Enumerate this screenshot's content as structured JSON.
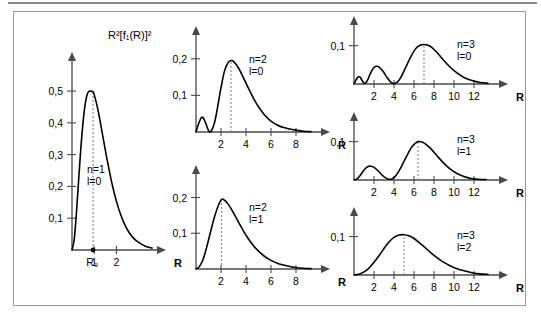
{
  "figure": {
    "y_axis_title": "R²[f₁(R)]²",
    "axis_letter": "R",
    "decimal_separator": ",",
    "frame_color": "#9a9a9a",
    "curve_color": "#000000",
    "axis_color": "#4a4a4a",
    "dashed_color": "#7a7a7a"
  },
  "panels": [
    {
      "id": "n1-l0",
      "n_label": "n=1",
      "l_label": "l=0",
      "y_ticks": [
        "0,1",
        "0,2",
        "0,3",
        "0,4",
        "0,5"
      ],
      "y_tick_values": [
        0.1,
        0.2,
        0.3,
        0.4,
        0.5
      ],
      "x_ticks": [
        "1",
        "2"
      ],
      "x_tick_values": [
        1,
        2
      ],
      "x_origin_label": "R₀",
      "x_axis_label": "R",
      "peak_r": 0.95,
      "peak_value": 0.5,
      "xlim": [
        0,
        3.6
      ],
      "ylim": [
        0,
        0.56
      ]
    },
    {
      "id": "n2-l0",
      "n_label": "n=2",
      "l_label": "l=0",
      "y_ticks": [
        "0,1",
        "0,2"
      ],
      "y_tick_values": [
        0.1,
        0.2
      ],
      "x_ticks": [
        "2",
        "4",
        "6",
        "8"
      ],
      "x_tick_values": [
        2,
        4,
        6,
        8
      ],
      "x_axis_label": "R",
      "peak_r": 2.8,
      "peak_value": 0.195,
      "xlim": [
        0,
        9.6
      ],
      "ylim": [
        0,
        0.235
      ]
    },
    {
      "id": "n2-l1",
      "n_label": "n=2",
      "l_label": "l=1",
      "y_ticks": [
        "0,1",
        "0,2"
      ],
      "y_tick_values": [
        0.1,
        0.2
      ],
      "x_ticks": [
        "2",
        "4",
        "6",
        "8"
      ],
      "x_tick_values": [
        2,
        4,
        6,
        8
      ],
      "x_axis_label": "R",
      "peak_r": 2.05,
      "peak_value": 0.195,
      "xlim": [
        0,
        9.6
      ],
      "ylim": [
        0,
        0.235
      ]
    },
    {
      "id": "n3-l0",
      "n_label": "n=3",
      "l_label": "l=0",
      "y_ticks": [
        "0,1"
      ],
      "y_tick_values": [
        0.1
      ],
      "x_ticks": [
        "2",
        "4",
        "6",
        "8",
        "10",
        "12"
      ],
      "x_tick_values": [
        2,
        4,
        6,
        8,
        10,
        12
      ],
      "x_axis_label": "R",
      "peak_r": 7.0,
      "peak_value": 0.103,
      "xlim": [
        0,
        14.0
      ],
      "ylim": [
        0,
        0.125
      ]
    },
    {
      "id": "n3-l1",
      "n_label": "n=3",
      "l_label": "l=1",
      "y_ticks": [
        "0,1"
      ],
      "y_tick_values": [
        0.1
      ],
      "x_ticks": [
        "2",
        "4",
        "6",
        "8",
        "10",
        "12"
      ],
      "x_tick_values": [
        2,
        4,
        6,
        8,
        10,
        12
      ],
      "x_axis_label": "R",
      "peak_r": 6.4,
      "peak_value": 0.1,
      "xlim": [
        0,
        14.0
      ],
      "ylim": [
        0,
        0.125
      ]
    },
    {
      "id": "n3-l2",
      "n_label": "n=3",
      "l_label": "l=2",
      "y_ticks": [
        "0,1"
      ],
      "y_tick_values": [
        0.1
      ],
      "x_ticks": [
        "2",
        "4",
        "6",
        "8",
        "10",
        "12"
      ],
      "x_tick_values": [
        2,
        4,
        6,
        8,
        10,
        12
      ],
      "x_axis_label": "R",
      "peak_r": 5.0,
      "peak_value": 0.105,
      "xlim": [
        0,
        14.0
      ],
      "ylim": [
        0,
        0.125
      ]
    }
  ],
  "chart_data": [
    {
      "type": "line",
      "id": "n1-l0",
      "title": "n=1, l=0",
      "xlabel": "R",
      "ylabel": "R²[f₁(R)]²",
      "xlim": [
        0,
        3.6
      ],
      "ylim": [
        0,
        0.56
      ],
      "grid": false,
      "annotations": [
        "R₀ marks the peak position"
      ],
      "x": [
        0,
        0.1,
        0.2,
        0.3,
        0.4,
        0.5,
        0.6,
        0.7,
        0.8,
        0.9,
        0.95,
        1.0,
        1.1,
        1.2,
        1.4,
        1.6,
        1.8,
        2.0,
        2.2,
        2.4,
        2.6,
        2.8,
        3.0,
        3.3,
        3.6
      ],
      "y": [
        0,
        0.033,
        0.117,
        0.222,
        0.322,
        0.404,
        0.462,
        0.493,
        0.5,
        0.499,
        0.497,
        0.488,
        0.462,
        0.43,
        0.353,
        0.277,
        0.209,
        0.153,
        0.109,
        0.076,
        0.052,
        0.035,
        0.024,
        0.012,
        0.006
      ]
    },
    {
      "type": "line",
      "id": "n2-l0",
      "title": "n=2, l=0",
      "xlabel": "R",
      "ylabel": "",
      "xlim": [
        0,
        9.6
      ],
      "ylim": [
        0,
        0.235
      ],
      "grid": false,
      "x": [
        0,
        0.2,
        0.4,
        0.5,
        0.6,
        0.8,
        1.0,
        1.2,
        1.5,
        1.8,
        2.0,
        2.3,
        2.6,
        2.8,
        3.0,
        3.4,
        3.8,
        4.2,
        4.6,
        5.0,
        5.5,
        6.0,
        6.5,
        7.0,
        7.5,
        8.0,
        8.6,
        9.2
      ],
      "y": [
        0,
        0.022,
        0.038,
        0.04,
        0.038,
        0.022,
        0.004,
        0.002,
        0.028,
        0.082,
        0.121,
        0.169,
        0.191,
        0.195,
        0.193,
        0.175,
        0.148,
        0.119,
        0.092,
        0.069,
        0.046,
        0.03,
        0.019,
        0.012,
        0.008,
        0.005,
        0.002,
        0.001
      ]
    },
    {
      "type": "line",
      "id": "n2-l1",
      "title": "n=2, l=1",
      "xlabel": "R",
      "ylabel": "",
      "xlim": [
        0,
        9.6
      ],
      "ylim": [
        0,
        0.235
      ],
      "grid": false,
      "x": [
        0,
        0.3,
        0.6,
        0.9,
        1.2,
        1.5,
        1.8,
        2.05,
        2.3,
        2.6,
        3.0,
        3.4,
        3.8,
        4.2,
        4.6,
        5.0,
        5.5,
        6.0,
        6.5,
        7.0,
        7.5,
        8.0,
        8.6,
        9.2
      ],
      "y": [
        0,
        0.008,
        0.03,
        0.067,
        0.109,
        0.148,
        0.179,
        0.195,
        0.192,
        0.18,
        0.157,
        0.131,
        0.106,
        0.084,
        0.065,
        0.05,
        0.035,
        0.024,
        0.016,
        0.011,
        0.007,
        0.004,
        0.002,
        0.001
      ]
    },
    {
      "type": "line",
      "id": "n3-l0",
      "title": "n=3, l=0",
      "xlabel": "R",
      "ylabel": "",
      "xlim": [
        0,
        14.0
      ],
      "ylim": [
        0,
        0.125
      ],
      "grid": false,
      "x": [
        0,
        0.2,
        0.4,
        0.5,
        0.6,
        0.8,
        1.0,
        1.3,
        1.6,
        1.9,
        2.2,
        2.5,
        2.9,
        3.3,
        3.7,
        4.0,
        4.3,
        4.7,
        5.2,
        5.7,
        6.2,
        6.6,
        7.0,
        7.4,
        7.8,
        8.3,
        8.9,
        9.5,
        10.2,
        11.0,
        11.8,
        12.6,
        13.4
      ],
      "y": [
        0,
        0.011,
        0.018,
        0.019,
        0.018,
        0.01,
        0.002,
        0.007,
        0.025,
        0.04,
        0.046,
        0.044,
        0.033,
        0.017,
        0.004,
        0.001,
        0.004,
        0.018,
        0.045,
        0.072,
        0.093,
        0.101,
        0.103,
        0.101,
        0.095,
        0.082,
        0.064,
        0.047,
        0.031,
        0.017,
        0.009,
        0.004,
        0.002
      ]
    },
    {
      "type": "line",
      "id": "n3-l1",
      "title": "n=3, l=1",
      "xlabel": "R",
      "ylabel": "",
      "xlim": [
        0,
        14.0
      ],
      "ylim": [
        0,
        0.125
      ],
      "grid": false,
      "x": [
        0,
        0.3,
        0.6,
        1.0,
        1.4,
        1.7,
        2.0,
        2.4,
        2.8,
        3.2,
        3.5,
        3.8,
        4.2,
        4.7,
        5.2,
        5.7,
        6.1,
        6.4,
        6.8,
        7.2,
        7.7,
        8.3,
        8.9,
        9.6,
        10.3,
        11.0,
        11.7,
        12.4,
        13.2
      ],
      "y": [
        0,
        0.003,
        0.011,
        0.026,
        0.035,
        0.036,
        0.033,
        0.024,
        0.013,
        0.005,
        0.002,
        0.003,
        0.012,
        0.033,
        0.059,
        0.083,
        0.095,
        0.1,
        0.099,
        0.093,
        0.081,
        0.063,
        0.046,
        0.029,
        0.017,
        0.009,
        0.004,
        0.002,
        0.001
      ]
    },
    {
      "type": "line",
      "id": "n3-l2",
      "title": "n=3, l=2",
      "xlabel": "R",
      "ylabel": "",
      "xlim": [
        0,
        14.0
      ],
      "ylim": [
        0,
        0.125
      ],
      "grid": false,
      "x": [
        0,
        0.5,
        1.0,
        1.5,
        2.0,
        2.5,
        3.0,
        3.5,
        4.0,
        4.5,
        5.0,
        5.5,
        6.0,
        6.5,
        7.0,
        7.6,
        8.2,
        8.9,
        9.6,
        10.3,
        11.0,
        11.8,
        12.6,
        13.4
      ],
      "y": [
        0,
        0.002,
        0.008,
        0.018,
        0.033,
        0.05,
        0.069,
        0.086,
        0.098,
        0.104,
        0.105,
        0.102,
        0.095,
        0.085,
        0.074,
        0.06,
        0.047,
        0.034,
        0.024,
        0.016,
        0.011,
        0.006,
        0.003,
        0.002
      ]
    }
  ]
}
